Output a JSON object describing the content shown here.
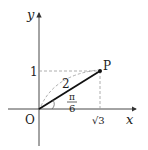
{
  "diagram": {
    "axes": {
      "x_label": "x",
      "y_label": "y",
      "origin_label": "O"
    },
    "point": {
      "label": "P",
      "x": "√3",
      "y": "1"
    },
    "segment": {
      "length_label": "2"
    },
    "angle": {
      "numerator": "π",
      "denominator": "6"
    },
    "tick_labels": {
      "x": "√3",
      "y": "1"
    },
    "colors": {
      "line": "#111111",
      "dashed": "#999999",
      "background": "#ffffff"
    }
  }
}
